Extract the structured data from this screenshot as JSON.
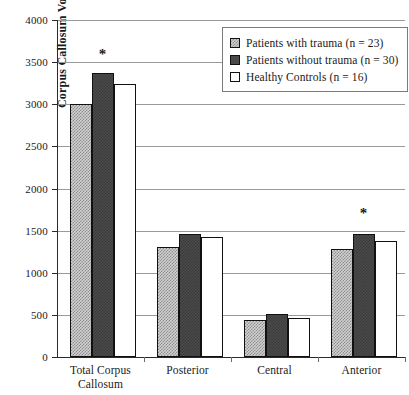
{
  "chart_data": {
    "type": "bar",
    "title": "",
    "xlabel": "",
    "ylabel": "Corpus Callosum Volume",
    "ylim": [
      0,
      4000
    ],
    "ytick_step": 500,
    "yticks": [
      "4000",
      "3500",
      "3000",
      "2500",
      "2000",
      "1500",
      "1000",
      "500",
      "0"
    ],
    "grid": true,
    "legend_position": "top-right",
    "categories": [
      "Total Corpus Callosum",
      "Posterior",
      "Central",
      "Anterior"
    ],
    "category_lines": [
      [
        "Total Corpus",
        "Callosum"
      ],
      [
        "Posterior"
      ],
      [
        "Central"
      ],
      [
        "Anterior"
      ]
    ],
    "series": [
      {
        "name": "Patients with trauma (n = 23)",
        "short_name": "Patients with trauma",
        "n": 23,
        "fill": "hatched-light",
        "color": "#d2d2d2",
        "values": [
          3000,
          1300,
          440,
          1280
        ]
      },
      {
        "name": "Patients without trauma (n = 30)",
        "short_name": "Patients without trauma",
        "n": 30,
        "fill": "solid-dark",
        "color": "#4a4a4a",
        "values": [
          3370,
          1455,
          510,
          1455
        ]
      },
      {
        "name": "Healthy Controls (n = 16)",
        "short_name": "Healthy Controls",
        "n": 16,
        "fill": "white-outline",
        "color": "#ffffff",
        "values": [
          3235,
          1420,
          460,
          1380
        ]
      }
    ],
    "annotations": [
      {
        "text": "*",
        "category": "Total Corpus Callosum",
        "value": 3600,
        "meaning": "significant-difference"
      },
      {
        "text": "*",
        "category": "Anterior",
        "value": 1710,
        "meaning": "significant-difference"
      }
    ]
  }
}
